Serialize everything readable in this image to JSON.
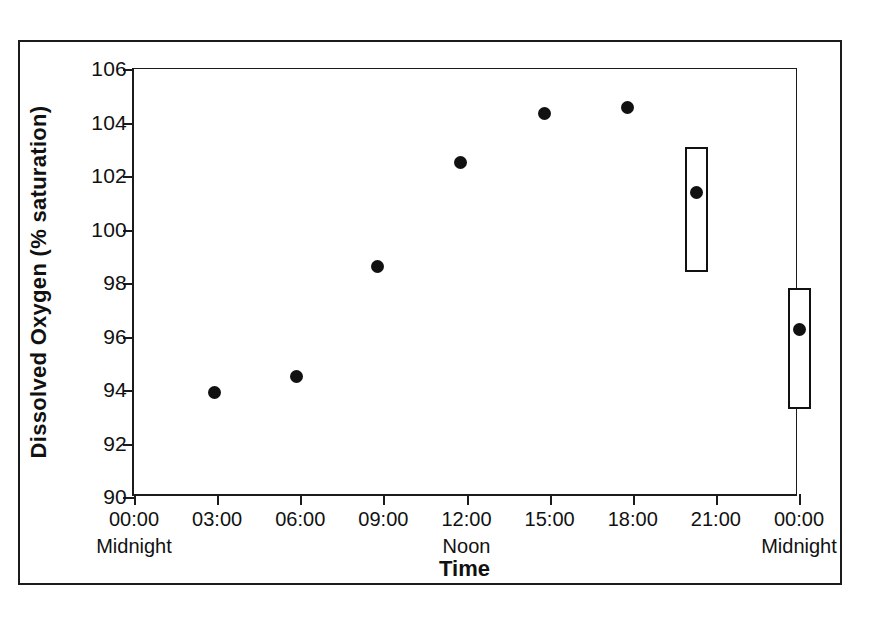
{
  "chart_data": {
    "type": "scatter",
    "title": "",
    "xlabel": "Time",
    "ylabel": "Dissolved Oxygen (% saturation)",
    "ylim": [
      90,
      106
    ],
    "ytick_values": [
      90,
      92,
      94,
      96,
      98,
      100,
      102,
      104,
      106
    ],
    "ytick_labels": [
      "90",
      "92",
      "94",
      "96",
      "98",
      "100",
      "102",
      "104",
      "106"
    ],
    "xlim_hours": [
      0,
      24
    ],
    "grid": false,
    "legend": "none",
    "xticks": [
      {
        "hours": 0,
        "label": "00:00",
        "sublabel": "Midnight"
      },
      {
        "hours": 3,
        "label": "03:00",
        "sublabel": ""
      },
      {
        "hours": 6,
        "label": "06:00",
        "sublabel": ""
      },
      {
        "hours": 9,
        "label": "09:00",
        "sublabel": ""
      },
      {
        "hours": 12,
        "label": "12:00",
        "sublabel": "Noon"
      },
      {
        "hours": 15,
        "label": "15:00",
        "sublabel": ""
      },
      {
        "hours": 18,
        "label": "18:00",
        "sublabel": ""
      },
      {
        "hours": 21,
        "label": "21:00",
        "sublabel": ""
      },
      {
        "hours": 24,
        "label": "00:00",
        "sublabel": "Midnight"
      }
    ],
    "series": [
      {
        "name": "Dissolved oxygen",
        "marker": "filled-circle",
        "color": "#111111",
        "points": [
          {
            "hours": 2.9,
            "value": 93.9
          },
          {
            "hours": 5.85,
            "value": 94.5
          },
          {
            "hours": 8.8,
            "value": 98.6
          },
          {
            "hours": 11.8,
            "value": 102.5
          },
          {
            "hours": 14.8,
            "value": 104.35
          },
          {
            "hours": 17.8,
            "value": 104.55
          },
          {
            "hours": 20.3,
            "value": 101.4
          },
          {
            "hours": 24.0,
            "value": 96.25
          }
        ]
      }
    ],
    "range_boxes": [
      {
        "hours": 20.3,
        "low": 98.4,
        "high": 103.1
      },
      {
        "hours": 24.0,
        "low": 93.3,
        "high": 97.8
      }
    ]
  },
  "figure": {
    "frame_color": "#1b1b1b",
    "background": "#ffffff",
    "axis_color": "#1b1b1b",
    "marker_color": "#111111"
  }
}
